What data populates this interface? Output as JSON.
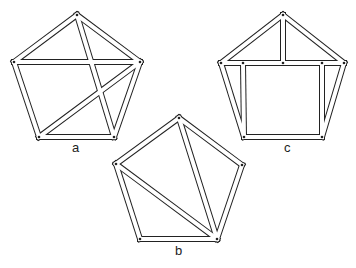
{
  "figures": [
    {
      "id": "a",
      "label": "a",
      "label_pos": [
        72,
        141
      ],
      "vertices": {
        "top": [
          77,
          15
        ],
        "left": [
          14,
          62
        ],
        "right": [
          140,
          62
        ],
        "bl": [
          39,
          137
        ],
        "br": [
          114,
          137
        ]
      },
      "bars": [
        [
          "top",
          "left"
        ],
        [
          "top",
          "right"
        ],
        [
          "left",
          "bl"
        ],
        [
          "right",
          "br"
        ],
        [
          "bl",
          "br"
        ],
        [
          "left",
          "right"
        ],
        [
          "top",
          "br"
        ],
        [
          "bl",
          "right"
        ]
      ],
      "extra_points": []
    },
    {
      "id": "b",
      "label": "b",
      "label_pos": [
        175,
        244
      ],
      "vertices": {
        "top": [
          179,
          118
        ],
        "left": [
          116,
          164
        ],
        "right": [
          242,
          165
        ],
        "bl": [
          140,
          239
        ],
        "br": [
          217,
          239
        ]
      },
      "bars": [
        [
          "top",
          "left"
        ],
        [
          "top",
          "right"
        ],
        [
          "left",
          "bl"
        ],
        [
          "right",
          "br"
        ],
        [
          "bl",
          "br"
        ],
        [
          "top",
          "br"
        ],
        [
          "left",
          "br"
        ]
      ],
      "extra_points": []
    },
    {
      "id": "c",
      "label": "c",
      "label_pos": [
        284,
        141
      ],
      "vertices": {
        "top": [
          283,
          15
        ],
        "left": [
          221,
          63
        ],
        "right": [
          344,
          63
        ],
        "bl": [
          244,
          137
        ],
        "br": [
          322,
          137
        ],
        "mid": [
          283,
          63
        ],
        "il": [
          243,
          63
        ],
        "ir": [
          322,
          63
        ]
      },
      "bars": [
        [
          "top",
          "left"
        ],
        [
          "top",
          "right"
        ],
        [
          "left",
          "bl"
        ],
        [
          "right",
          "br"
        ],
        [
          "bl",
          "br"
        ],
        [
          "left",
          "right"
        ],
        [
          "top",
          "mid"
        ],
        [
          "il",
          "bl"
        ],
        [
          "ir",
          "br"
        ]
      ],
      "extra_points": [
        "mid",
        "il",
        "ir"
      ]
    }
  ],
  "style": {
    "stroke": "#222222",
    "fill": "#ffffff",
    "bar_width": 6,
    "joint_radius": 1.3
  }
}
